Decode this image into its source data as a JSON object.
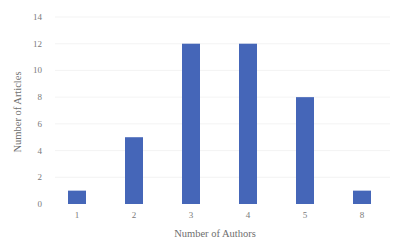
{
  "chart_data": {
    "type": "bar",
    "title": "",
    "xlabel": "Number of Authors",
    "ylabel": "Number of Articles",
    "categories": [
      "1",
      "2",
      "3",
      "4",
      "5",
      "8"
    ],
    "values": [
      1,
      5,
      12,
      12,
      8,
      1
    ],
    "ylim": [
      0,
      14
    ],
    "yticks": [
      "0",
      "2",
      "4",
      "6",
      "8",
      "10",
      "12",
      "14"
    ],
    "grid": true,
    "legend": "none",
    "bar_color": "#4566b8"
  }
}
